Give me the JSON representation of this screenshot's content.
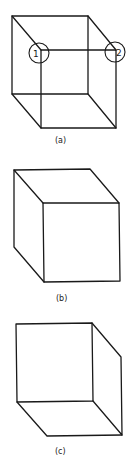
{
  "figure": {
    "panels": [
      {
        "id": "a",
        "caption": "(a)",
        "description": "Wireframe (Necker) cube with all edges visible",
        "markers": [
          {
            "label": "1",
            "vertex": "front-top-left"
          },
          {
            "label": "2",
            "vertex": "front-top-right"
          }
        ]
      },
      {
        "id": "b",
        "caption": "(b)",
        "description": "Solid cube interpretation viewed from above (front face lower-right)"
      },
      {
        "id": "c",
        "caption": "(c)",
        "description": "Solid cube interpretation viewed from below (front face upper-left)"
      }
    ],
    "colors": {
      "stroke": "#1a1a1a",
      "background": "#ffffff"
    }
  }
}
